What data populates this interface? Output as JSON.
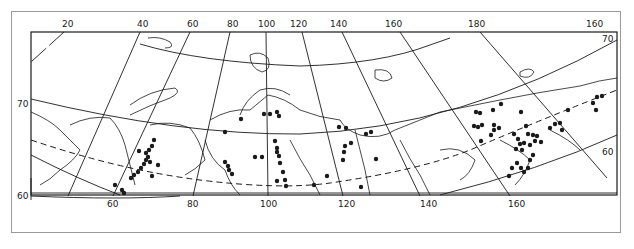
{
  "map": {
    "type": "distribution map",
    "region": "Northern Eurasia / Siberia",
    "longitude_labels_top": [
      "20",
      "40",
      "60",
      "80",
      "100",
      "120",
      "140",
      "160",
      "180",
      "160"
    ],
    "longitude_labels_bottom": [
      "60",
      "80",
      "100",
      "120",
      "140",
      "160"
    ],
    "latitude_labels_left": [
      "70",
      "60"
    ],
    "latitude_labels_right": [
      "70",
      "60"
    ],
    "colors": {
      "ink": "#1a1a1a",
      "background": "#ffffff",
      "frame": "#9a9a9a"
    },
    "legend": null
  }
}
